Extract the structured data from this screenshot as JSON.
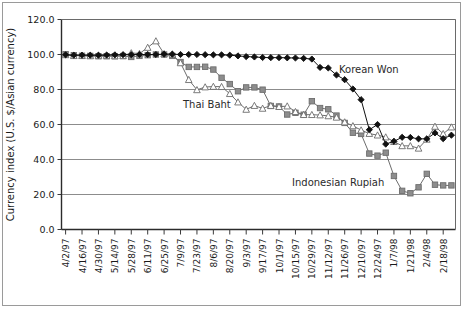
{
  "chart_data": {
    "type": "line",
    "title": "",
    "xlabel": "",
    "ylabel": "Currency index (U.S. $/Asian currency)",
    "ylim": [
      0.0,
      120.0
    ],
    "yticks": [
      "0.0",
      "20.0",
      "40.0",
      "60.0",
      "80.0",
      "100.0",
      "120.0"
    ],
    "ytick_values": [
      0,
      20,
      40,
      60,
      80,
      100,
      120
    ],
    "grid": "horizontal",
    "legend_position": "inline-annotations",
    "x": [
      "4/2/97",
      "4/9/97",
      "4/16/97",
      "4/23/97",
      "4/30/97",
      "5/7/97",
      "5/14/97",
      "5/21/97",
      "5/28/97",
      "6/4/97",
      "6/11/97",
      "6/18/97",
      "6/25/97",
      "7/2/97",
      "7/9/97",
      "7/16/97",
      "7/23/97",
      "7/30/97",
      "8/6/97",
      "8/13/97",
      "8/20/97",
      "8/27/97",
      "9/3/97",
      "9/10/97",
      "9/17/97",
      "9/24/97",
      "10/1/97",
      "10/8/97",
      "10/15/97",
      "10/22/97",
      "10/29/97",
      "11/5/97",
      "11/12/97",
      "11/19/97",
      "11/26/97",
      "12/3/97",
      "12/10/97",
      "12/17/97",
      "12/24/97",
      "12/31/97",
      "1/7/98",
      "1/14/98",
      "1/21/98",
      "1/28/98",
      "2/4/98",
      "2/11/98",
      "2/18/98",
      "2/25/98"
    ],
    "xtick_labels": [
      "4/2/97",
      "4/16/97",
      "4/30/97",
      "5/14/97",
      "5/28/97",
      "6/11/97",
      "6/25/97",
      "7/9/97",
      "7/23/97",
      "8/6/97",
      "8/20/97",
      "9/3/97",
      "9/17/97",
      "10/1/97",
      "10/15/97",
      "10/29/97",
      "11/12/97",
      "11/26/97",
      "12/10/97",
      "12/24/97",
      "1/7/98",
      "1/21/98",
      "2/4/98",
      "2/18/98"
    ],
    "series": [
      {
        "name": "Korean Won",
        "marker": "diamond",
        "color": "#111111",
        "fill": "#111111",
        "values": [
          99.8,
          99.6,
          99.6,
          99.6,
          99.6,
          99.7,
          99.8,
          99.9,
          99.9,
          100.0,
          100.0,
          100.0,
          100.2,
          100.2,
          100.0,
          100.0,
          100.0,
          99.9,
          99.8,
          99.8,
          99.6,
          99.2,
          98.8,
          98.6,
          98.3,
          98.2,
          98.2,
          98.1,
          98.0,
          97.8,
          97.4,
          92.6,
          92.3,
          88.3,
          85.6,
          80.3,
          74.2,
          57.0,
          60.0,
          48.8,
          50.4,
          52.7,
          52.6,
          51.8,
          51.8,
          55.2,
          51.9,
          53.9
        ]
      },
      {
        "name": "Thai Baht",
        "marker": "triangle",
        "color": "#6d6d6d",
        "fill": "#ffffff",
        "values": [
          99.8,
          99.3,
          99.3,
          99.2,
          99.4,
          99.4,
          99.2,
          99.3,
          100.9,
          100.5,
          104.0,
          107.7,
          100.4,
          100.2,
          95.2,
          85.6,
          79.8,
          81.4,
          81.7,
          81.6,
          77.6,
          72.8,
          68.6,
          70.8,
          69.2,
          70.8,
          70.2,
          70.5,
          67.3,
          65.6,
          65.6,
          65.4,
          64.9,
          64.1,
          61.4,
          59.2,
          56.8,
          54.8,
          53.9,
          52.8,
          50.2,
          47.8,
          47.8,
          46.4,
          51.5,
          58.9,
          54.7,
          58.5
        ]
      },
      {
        "name": "Indonesian Rupiah",
        "marker": "square",
        "color": "#6d6d6d",
        "fill": "#8d8d8d",
        "values": [
          100.2,
          99.6,
          99.3,
          99.2,
          99.0,
          99.0,
          99.0,
          99.1,
          98.6,
          99.2,
          99.6,
          100.0,
          100.0,
          99.2,
          95.7,
          92.9,
          92.9,
          93.0,
          91.4,
          86.7,
          83.1,
          79.0,
          81.2,
          81.2,
          79.9,
          70.6,
          70.3,
          65.7,
          66.7,
          65.6,
          73.3,
          69.4,
          68.7,
          65.1,
          60.9,
          55.3,
          54.6,
          43.4,
          42.2,
          43.9,
          30.6,
          22.1,
          20.7,
          24.1,
          31.8,
          25.6,
          25.2,
          25.2
        ]
      }
    ],
    "annotations": [
      {
        "text": "Korean Won",
        "series": "Korean Won"
      },
      {
        "text": "Thai Baht",
        "series": "Thai Baht"
      },
      {
        "text": "Indonesian Rupiah",
        "series": "Indonesian Rupiah"
      }
    ]
  }
}
